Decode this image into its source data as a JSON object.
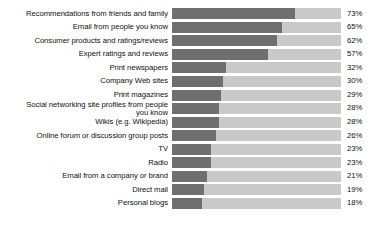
{
  "chart_data": {
    "type": "bar",
    "orientation": "horizontal",
    "title": "",
    "subtitle": "",
    "xlabel": "",
    "ylabel": "",
    "xlim": [
      0,
      100
    ],
    "grid": false,
    "legend": null,
    "value_suffix": "%",
    "colors": {
      "bar_fill": "#6f6f6f",
      "bar_track": "#c9c9c9",
      "background": "#ffffff",
      "text": "#101010"
    },
    "categories": [
      "Recommendations from friends and family",
      "Email from people you know",
      "Consumer products and ratings/reviews",
      "Expert ratings and reviews",
      "Print newspapers",
      "Company Web sites",
      "Print magazines",
      "Social networking site profiles from people\nyou know",
      "Wikis (e.g. Wikipedia)",
      "Online forum or discussion group posts",
      "TV",
      "Radio",
      "Email from a company or brand",
      "Direct mail",
      "Personal blogs"
    ],
    "values": [
      73,
      65,
      62,
      57,
      32,
      30,
      29,
      28,
      28,
      26,
      23,
      23,
      21,
      19,
      18
    ],
    "value_labels": [
      "73%",
      "65%",
      "62%",
      "57%",
      "32%",
      "30%",
      "29%",
      "28%",
      "28%",
      "26%",
      "23%",
      "23%",
      "21%",
      "19%",
      "18%"
    ]
  }
}
